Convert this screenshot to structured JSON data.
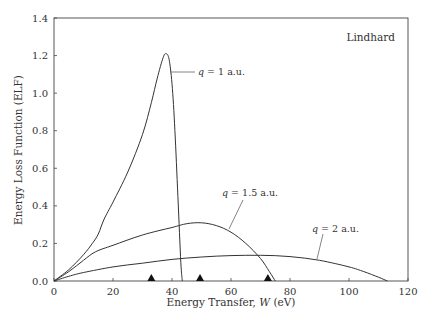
{
  "chart_data": {
    "type": "line",
    "title": "",
    "inset_label": "Lindhard",
    "xlabel": "Energy Transfer, W (eV)",
    "ylabel": "Energy Loss Function (ELF)",
    "xlim": [
      0,
      120
    ],
    "ylim": [
      0,
      1.4
    ],
    "xticks": [
      0,
      20,
      40,
      60,
      80,
      100,
      120
    ],
    "yticks": [
      0.0,
      0.2,
      0.4,
      0.6,
      0.8,
      1.0,
      1.2,
      1.4
    ],
    "xtick_labels": [
      "0",
      "20",
      "40",
      "60",
      "80",
      "100",
      "120"
    ],
    "ytick_labels": [
      "0.0",
      "0.2",
      "0.4",
      "0.6",
      "0.8",
      "1.0",
      "1.2",
      "1.4"
    ],
    "grid": false,
    "legend": "none (curves annotated directly)",
    "series": [
      {
        "name": "q = 1 a.u.",
        "label": "q = 1 a.u.",
        "points": [
          [
            0,
            0
          ],
          [
            5,
            0.06
          ],
          [
            10,
            0.14
          ],
          [
            13,
            0.2
          ],
          [
            15,
            0.25
          ],
          [
            17,
            0.33
          ],
          [
            20,
            0.42
          ],
          [
            25,
            0.58
          ],
          [
            30,
            0.78
          ],
          [
            33,
            0.95
          ],
          [
            35,
            1.08
          ],
          [
            37,
            1.19
          ],
          [
            38,
            1.21
          ],
          [
            39,
            1.18
          ],
          [
            40,
            1.05
          ],
          [
            41,
            0.8
          ],
          [
            42,
            0.45
          ],
          [
            43,
            0.1
          ],
          [
            43.5,
            0
          ]
        ]
      },
      {
        "name": "q = 1.5 a.u.",
        "label": "q = 1.5 a.u.",
        "points": [
          [
            0,
            0
          ],
          [
            5,
            0.05
          ],
          [
            10,
            0.11
          ],
          [
            14,
            0.155
          ],
          [
            20,
            0.19
          ],
          [
            30,
            0.245
          ],
          [
            40,
            0.285
          ],
          [
            45,
            0.305
          ],
          [
            50,
            0.31
          ],
          [
            55,
            0.295
          ],
          [
            60,
            0.26
          ],
          [
            65,
            0.2
          ],
          [
            70,
            0.12
          ],
          [
            73,
            0.05
          ],
          [
            75,
            0
          ]
        ]
      },
      {
        "name": "q = 2 a.u.",
        "label": "q = 2 a.u.",
        "points": [
          [
            0,
            0
          ],
          [
            5,
            0.025
          ],
          [
            10,
            0.045
          ],
          [
            20,
            0.075
          ],
          [
            30,
            0.095
          ],
          [
            40,
            0.115
          ],
          [
            50,
            0.128
          ],
          [
            60,
            0.135
          ],
          [
            70,
            0.137
          ],
          [
            80,
            0.13
          ],
          [
            90,
            0.11
          ],
          [
            100,
            0.075
          ],
          [
            105,
            0.05
          ],
          [
            110,
            0.02
          ],
          [
            113,
            0
          ]
        ]
      }
    ],
    "markers": {
      "shape": "triangle",
      "x": [
        33,
        49.5,
        72.5
      ],
      "y": [
        0,
        0,
        0
      ]
    }
  }
}
